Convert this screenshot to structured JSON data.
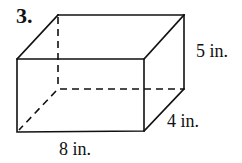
{
  "problem": {
    "number": "3.",
    "figure": "rectangular-prism",
    "dimensions": {
      "length": "8 in.",
      "width": "4 in.",
      "height": "5 in."
    }
  },
  "style": {
    "line_color": "#111111",
    "background": "#ffffff"
  }
}
